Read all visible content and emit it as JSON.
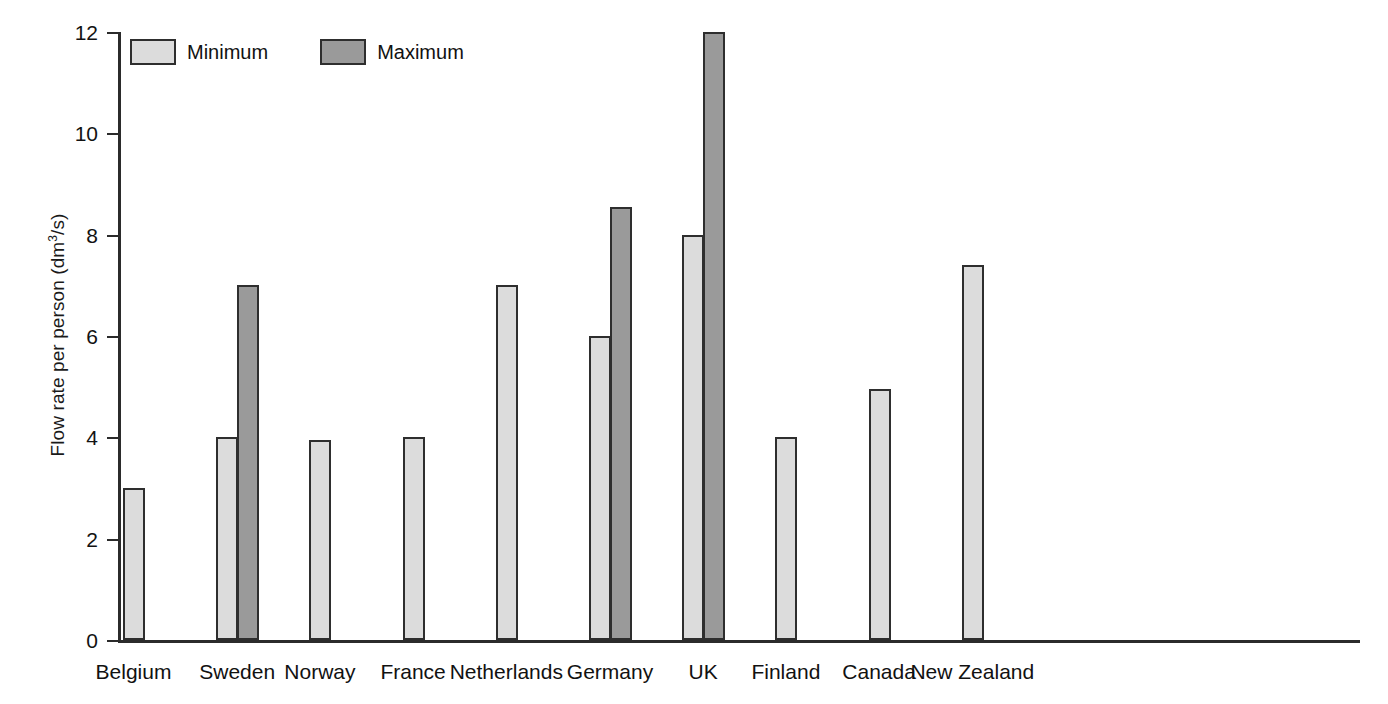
{
  "chart_data": {
    "type": "bar",
    "title": "",
    "xlabel": "",
    "ylabel": "Flow rate per person (dm3/s)",
    "ylabel_prefix": "Flow rate per person (dm",
    "ylabel_superscript": "3",
    "ylabel_suffix": "/s)",
    "ylim": [
      0,
      12
    ],
    "yticks": [
      0,
      2,
      4,
      6,
      8,
      10,
      12
    ],
    "ytick_labels": [
      "0",
      "2",
      "4",
      "6",
      "8",
      "10",
      "12"
    ],
    "grid": false,
    "legend_position": "top-left",
    "categories": [
      "Belgium",
      "Sweden",
      "Norway",
      "France",
      "Netherlands",
      "Germany",
      "UK",
      "Finland",
      "Canada",
      "New Zealand"
    ],
    "series": [
      {
        "name": "Minimum",
        "color": "#dcdcdc",
        "values": [
          3.0,
          4.0,
          3.95,
          4.0,
          7.0,
          6.0,
          8.0,
          4.0,
          4.95,
          7.4
        ]
      },
      {
        "name": "Maximum",
        "color": "#9a9a9a",
        "values": [
          null,
          7.0,
          null,
          null,
          null,
          8.55,
          12.0,
          null,
          null,
          null
        ]
      }
    ]
  },
  "legend": {
    "entries": [
      {
        "label": "Minimum",
        "swatch": "minimum"
      },
      {
        "label": "Maximum",
        "swatch": "maximum"
      }
    ]
  },
  "colors": {
    "minimum": "#dcdcdc",
    "maximum": "#9a9a9a",
    "axis": "#2b2b2b",
    "text": "#111111",
    "background": "#ffffff"
  }
}
